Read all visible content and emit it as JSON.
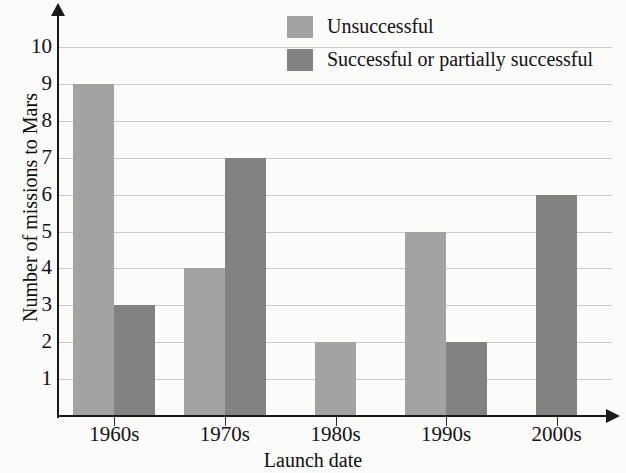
{
  "chart_data": {
    "type": "bar",
    "title": "",
    "xlabel": "Launch date",
    "ylabel": "Number of missions to Mars",
    "categories": [
      "1960s",
      "1970s",
      "1980s",
      "1990s",
      "2000s"
    ],
    "series": [
      {
        "name": "Unsuccessful",
        "color": "#a3a3a3",
        "values": [
          9,
          4,
          2,
          5,
          0
        ]
      },
      {
        "name": "Successful or partially successful",
        "color": "#828282",
        "values": [
          3,
          7,
          0,
          2,
          6
        ]
      }
    ],
    "ylim": [
      0,
      10.8
    ],
    "yticks": [
      1,
      2,
      3,
      4,
      5,
      6,
      7,
      8,
      9,
      10
    ],
    "ytick_labels": [
      "1",
      "2",
      "3",
      "4",
      "5",
      "6",
      "7",
      "8",
      "9",
      "10"
    ],
    "grid": true,
    "grid_axis": "y",
    "legend_position": "top-center-right",
    "bar_style": "grouped",
    "axis_style": "arrow-ended"
  },
  "legend": {
    "entries": [
      {
        "label": "Unsuccessful",
        "color": "#a3a3a3"
      },
      {
        "label": "Successful or partially successful",
        "color": "#828282"
      }
    ]
  },
  "axes": {
    "x_title": "Launch date",
    "y_title": "Number of missions to Mars"
  }
}
